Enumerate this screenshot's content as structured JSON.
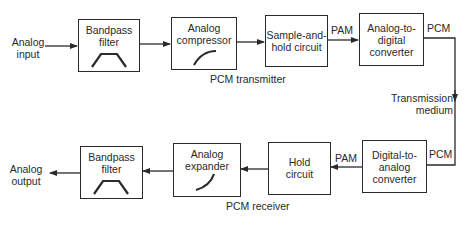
{
  "transmitter": {
    "caption": "PCM transmitter",
    "input_label": "Analog\ninput",
    "blocks": [
      {
        "label": "Bandpass\nfilter",
        "icon": "bandpass-shape"
      },
      {
        "label": "Analog\ncompressor",
        "icon": "compressor-curve"
      },
      {
        "label": "Sample-and-\nhold circuit"
      },
      {
        "label": "Analog-to-\ndigital\nconverter"
      }
    ],
    "signals": {
      "after_sample_hold": "PAM",
      "after_adc": "PCM"
    }
  },
  "channel": {
    "label": "Transmission\nmedium"
  },
  "receiver": {
    "caption": "PCM receiver",
    "output_label": "Analog\noutput",
    "blocks": [
      {
        "label": "Digital-to-\nanalog\nconverter"
      },
      {
        "label": "Hold\ncircuit"
      },
      {
        "label": "Analog\nexpander",
        "icon": "expander-curve"
      },
      {
        "label": "Bandpass\nfilter",
        "icon": "bandpass-shape"
      }
    ],
    "signals": {
      "into_dac": "PCM",
      "after_dac": "PAM"
    }
  },
  "colors": {
    "ink": "#2a2a2a",
    "background": "#ffffff"
  }
}
